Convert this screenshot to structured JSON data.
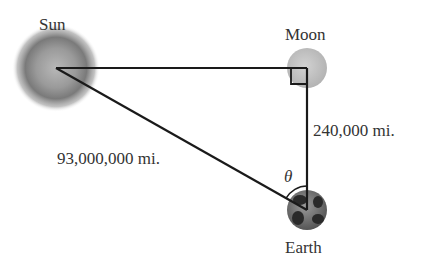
{
  "diagram": {
    "bodies": {
      "sun": {
        "label": "Sun"
      },
      "moon": {
        "label": "Moon"
      },
      "earth": {
        "label": "Earth"
      }
    },
    "distances": {
      "sun_earth": "93,000,000 mi.",
      "earth_moon": "240,000 mi."
    },
    "angle_label": "θ",
    "right_angle_at": "Moon",
    "colors": {
      "line": "#1a1a1a",
      "text": "#333333",
      "sun": "#8a8a8a",
      "moon": "#c4c4c4",
      "earth": "#6a6a6a"
    }
  }
}
